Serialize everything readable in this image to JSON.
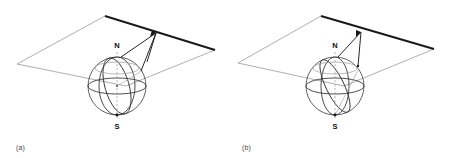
{
  "figure": {
    "panels": [
      {
        "caption": "(a)",
        "north_pole_label": "N",
        "south_pole_label": "S",
        "colors": {
          "plane_edge_thick": "#1a1a1a",
          "plane_edge_thin": "#8c8c8c",
          "sphere_outline": "#3a3a3a",
          "sphere_curve": "#2e2e2e",
          "axis_dashed": "#9a9a9a",
          "ray": "#1a1a1a",
          "background": "#ffffff",
          "caption_text": "#4a4a4a"
        },
        "geometry": {
          "plane": {
            "top_vertex": [
              105,
              16
            ],
            "right_vertex": [
              215,
              50
            ],
            "bottom_vertex": [
              126,
              86
            ],
            "left_vertex": [
              17,
              64
            ]
          },
          "sphere": {
            "center": [
              117,
              86
            ],
            "radius": 29
          },
          "north_pole_point": [
            117,
            57
          ],
          "south_pole_point": [
            117,
            115
          ],
          "projection_point_on_plane": [
            156,
            33
          ],
          "tangent_point_on_sphere": [
            141,
            71
          ]
        }
      },
      {
        "caption": "(b)",
        "north_pole_label": "N",
        "south_pole_label": "S",
        "colors": {
          "plane_edge_thick": "#1a1a1a",
          "plane_edge_thin": "#8c8c8c",
          "sphere_outline": "#3a3a3a",
          "sphere_curve": "#2e2e2e",
          "axis_dashed": "#9a9a9a",
          "ray": "#1a1a1a",
          "background": "#ffffff",
          "caption_text": "#4a4a4a"
        },
        "geometry": {
          "plane": {
            "top_vertex": [
              95,
              16
            ],
            "right_vertex": [
              208,
              49
            ],
            "bottom_vertex": [
              118,
              86
            ],
            "left_vertex": [
              12,
              63
            ]
          },
          "sphere": {
            "center": [
              109,
              86
            ],
            "radius": 29
          },
          "north_pole_point": [
            109,
            57
          ],
          "south_pole_point": [
            109,
            115
          ],
          "projection_point_on_plane": [
            135,
            32
          ],
          "tangent_point_on_sphere": [
            132,
            66
          ]
        }
      }
    ]
  }
}
